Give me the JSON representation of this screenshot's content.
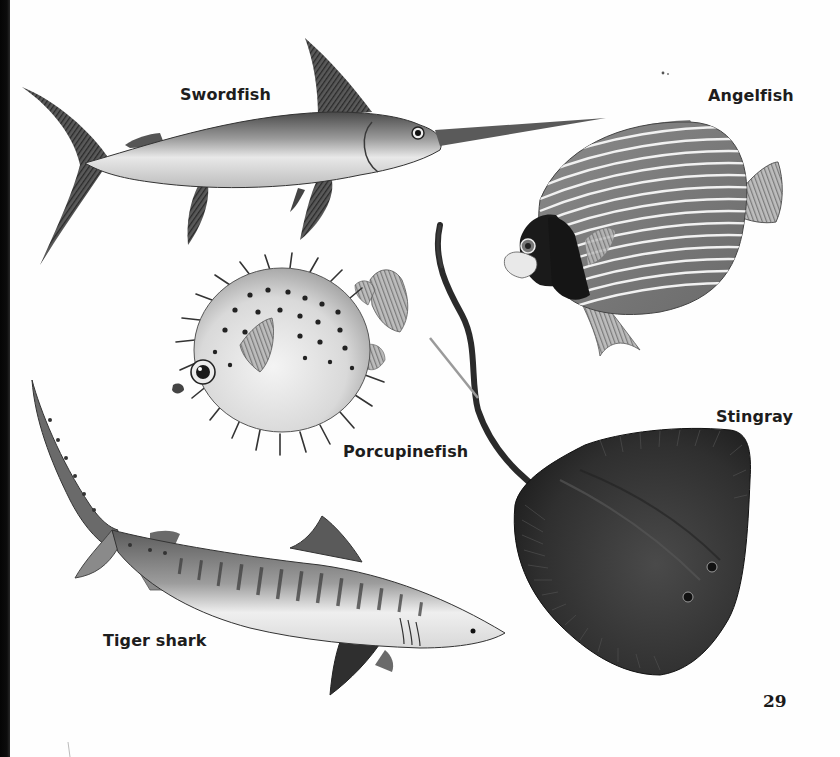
{
  "page": {
    "number": "29",
    "background": "#fefefe",
    "ink": "#1d1d1d"
  },
  "figures": [
    {
      "id": "swordfish",
      "label": "Swordfish"
    },
    {
      "id": "angelfish",
      "label": "Angelfish"
    },
    {
      "id": "porcupinefish",
      "label": "Porcupinefish"
    },
    {
      "id": "stingray",
      "label": "Stingray"
    },
    {
      "id": "tiger-shark",
      "label": "Tiger shark"
    }
  ]
}
